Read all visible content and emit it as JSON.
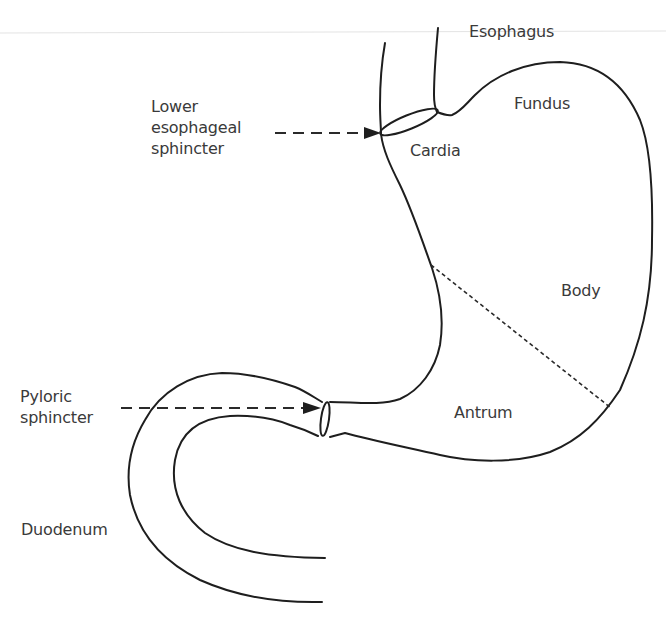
{
  "figure": {
    "labels": {
      "esophagus": "Esophagus",
      "fundus": "Fundus",
      "cardia": "Cardia",
      "body": "Body",
      "antrum": "Antrum",
      "lower_esophageal_sphincter": "Lower\nesophageal\nsphincter",
      "pyloric_sphincter": "Pyloric\nsphincter",
      "duodenum": "Duodenum"
    },
    "colors": {
      "line": "#1e1e1e",
      "text": "#3a3a3a",
      "background": "#ffffff",
      "rule": "#e3e3e3"
    }
  }
}
